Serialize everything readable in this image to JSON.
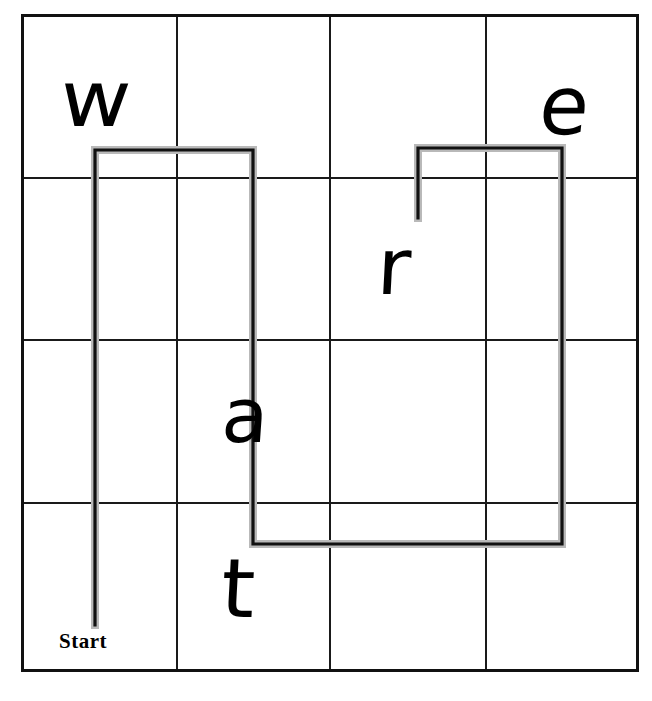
{
  "canvas": {
    "width": 652,
    "height": 701,
    "background": "#ffffff"
  },
  "grid": {
    "columns": 4,
    "rows": 4,
    "left": 22,
    "top": 15,
    "right": 637,
    "bottom": 670,
    "x_lines": [
      22,
      177,
      330,
      486,
      637
    ],
    "y_lines": [
      15,
      178,
      340,
      503,
      670
    ],
    "line_color": "#1a1a1a",
    "border_color": "#111111"
  },
  "path": {
    "color": "#111111",
    "halo_color": "#b9b9b9",
    "start_point": [
      95,
      625
    ],
    "points": [
      [
        95,
        625
      ],
      [
        95,
        150
      ],
      [
        253,
        150
      ],
      [
        253,
        544
      ],
      [
        562,
        544
      ],
      [
        562,
        148
      ],
      [
        418,
        148
      ],
      [
        418,
        218
      ]
    ],
    "start_label": "Start"
  },
  "letters": [
    {
      "id": "w",
      "char": "w",
      "x": 95,
      "y": 100
    },
    {
      "id": "e",
      "char": "e",
      "x": 565,
      "y": 110
    },
    {
      "id": "r",
      "char": "r",
      "x": 398,
      "y": 270
    },
    {
      "id": "a",
      "char": "a",
      "x": 253,
      "y": 415
    },
    {
      "id": "t",
      "char": "t",
      "x": 252,
      "y": 593
    }
  ],
  "chart_data": {
    "type": "diagram",
    "title": "",
    "grid_size": [
      4,
      4
    ],
    "letter_sequence": [
      "w",
      "e",
      "r",
      "a",
      "t"
    ],
    "path_vertices": [
      [
        95,
        625
      ],
      [
        95,
        150
      ],
      [
        253,
        150
      ],
      [
        253,
        544
      ],
      [
        562,
        544
      ],
      [
        562,
        148
      ],
      [
        418,
        148
      ],
      [
        418,
        218
      ]
    ],
    "path_start_label": "Start"
  }
}
